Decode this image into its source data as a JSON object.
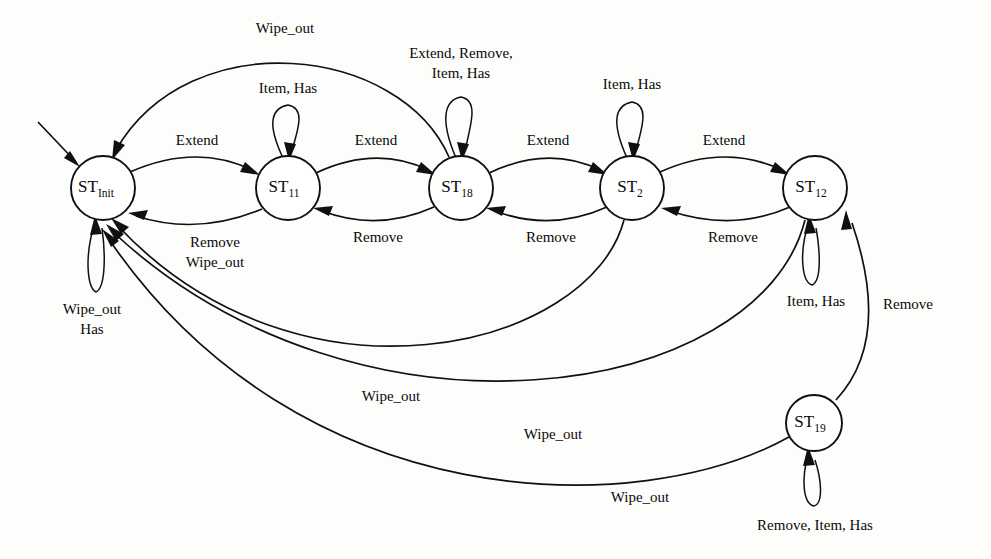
{
  "diagram": {
    "type": "finite-state-machine",
    "title": "",
    "canvas": {
      "width": 991,
      "height": 559
    },
    "colors": {
      "stroke": "#101010",
      "node_fill": "#ffffff",
      "background": "#fdfdfb"
    },
    "states": [
      {
        "id": "init",
        "base": "ST",
        "sub": "Init",
        "cx": 103,
        "cy": 188,
        "r": 32,
        "initial": true
      },
      {
        "id": "s11",
        "base": "ST",
        "sub": "11",
        "cx": 288,
        "cy": 188,
        "r": 32,
        "initial": false
      },
      {
        "id": "s18",
        "base": "ST",
        "sub": "18",
        "cx": 461,
        "cy": 188,
        "r": 32,
        "initial": false
      },
      {
        "id": "s2",
        "base": "ST",
        "sub": "2",
        "cx": 632,
        "cy": 188,
        "r": 32,
        "initial": false
      },
      {
        "id": "s12",
        "base": "ST",
        "sub": "12",
        "cx": 815,
        "cy": 188,
        "r": 32,
        "initial": false
      },
      {
        "id": "s19",
        "base": "ST",
        "sub": "19",
        "cx": 814,
        "cy": 423,
        "r": 28,
        "initial": false
      }
    ],
    "self_loops": [
      {
        "state": "s11",
        "label": "Item, Has",
        "lx": 288,
        "ly": 90,
        "lines": [
          "Item, Has"
        ]
      },
      {
        "state": "s18",
        "label": "Extend, Remove, Item, Has",
        "lx": 461,
        "ly": 62,
        "lines": [
          "Extend, Remove,",
          "Item, Has"
        ]
      },
      {
        "state": "s2",
        "label": "Item, Has",
        "lx": 632,
        "ly": 86,
        "lines": [
          "Item, Has"
        ]
      },
      {
        "state": "init",
        "label": "Wipe_out Has",
        "lx": 92,
        "ly": 318,
        "lines": [
          "Wipe_out",
          "Has"
        ]
      },
      {
        "state": "s12",
        "label": "Item, Has",
        "lx": 816,
        "ly": 309,
        "lines": [
          "Item, Has"
        ]
      },
      {
        "state": "s19",
        "label": "Remove, Item, Has",
        "lx": 815,
        "ly": 527,
        "lines": [
          "Remove, Item, Has"
        ]
      }
    ],
    "transitions": [
      {
        "from": "init",
        "to": "s11",
        "label": "Extend",
        "lx": 197,
        "ly": 142
      },
      {
        "from": "s11",
        "to": "s18",
        "label": "Extend",
        "lx": 376,
        "ly": 142
      },
      {
        "from": "s18",
        "to": "s2",
        "label": "Extend",
        "lx": 548,
        "ly": 142
      },
      {
        "from": "s2",
        "to": "s12",
        "label": "Extend",
        "lx": 724,
        "ly": 142
      },
      {
        "from": "s11",
        "to": "init",
        "label": "Remove Wipe_out",
        "lx": 215,
        "ly": 252,
        "lines": [
          "Remove",
          "Wipe_out"
        ]
      },
      {
        "from": "s18",
        "to": "s11",
        "label": "Remove",
        "lx": 378,
        "ly": 239
      },
      {
        "from": "s2",
        "to": "s18",
        "label": "Remove",
        "lx": 551,
        "ly": 239
      },
      {
        "from": "s12",
        "to": "s2",
        "label": "Remove",
        "lx": 733,
        "ly": 239
      },
      {
        "from": "s19",
        "to": "s12",
        "label": "Remove",
        "lx": 908,
        "ly": 306
      },
      {
        "from": "s18",
        "to": "init",
        "label": "Wipe_out",
        "lx": 285,
        "ly": 30
      },
      {
        "from": "s2",
        "to": "init",
        "label": "Wipe_out",
        "lx": 391,
        "ly": 398
      },
      {
        "from": "s12",
        "to": "init",
        "label": "Wipe_out",
        "lx": 553,
        "ly": 436
      },
      {
        "from": "s19",
        "to": "init",
        "label": "Wipe_out",
        "lx": 640,
        "ly": 499
      }
    ]
  }
}
